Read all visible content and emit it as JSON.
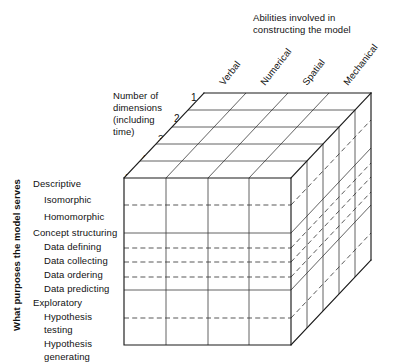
{
  "figure": {
    "type": "3d-cube-taxonomy-diagram",
    "title_top": {
      "line1": "Abilities involved in",
      "line2": "constructing the model"
    },
    "axis_depth": {
      "label_lines": [
        "Number of",
        "dimensions",
        "(including",
        "time)"
      ],
      "ticks": [
        "1",
        "2",
        "3",
        "4",
        "n"
      ]
    },
    "axis_left": {
      "label": "What purposes the model serves"
    },
    "columns": [
      {
        "label": "Verbal"
      },
      {
        "label": "Numerical"
      },
      {
        "label": "Spatial"
      },
      {
        "label": "Mechanical"
      }
    ],
    "rows": [
      {
        "label": "Descriptive",
        "level": "major"
      },
      {
        "label": "Isomorphic",
        "level": "sub"
      },
      {
        "label": "Homomorphic",
        "level": "sub"
      },
      {
        "label": "Concept structuring",
        "level": "major"
      },
      {
        "label": "Data  defining",
        "level": "sub"
      },
      {
        "label": "Data  collecting",
        "level": "sub"
      },
      {
        "label": "Data  ordering",
        "level": "sub"
      },
      {
        "label": "Data  predicting",
        "level": "sub"
      },
      {
        "label": "Exploratory",
        "level": "major"
      },
      {
        "label": "Hypothesis",
        "level": "sub"
      },
      {
        "label": "testing",
        "level": "sub-cont"
      },
      {
        "label": "Hypothesis",
        "level": "sub"
      },
      {
        "label": "generating",
        "level": "sub-cont"
      }
    ],
    "colors": {
      "ink": "#1a1a1a",
      "grid": "#3a3a3a",
      "background": "#ffffff"
    }
  }
}
